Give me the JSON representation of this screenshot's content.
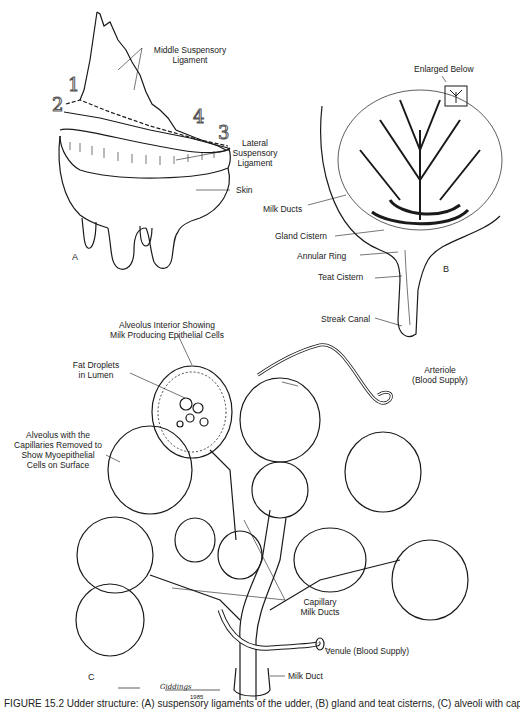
{
  "figure": {
    "panels": [
      {
        "id": "A",
        "letter": "A",
        "labels": {
          "middle_suspensory_ligament": "Middle Suspensory\nLigament",
          "middle_line1": "Middle Suspensory",
          "middle_line2": "Ligament",
          "lateral_line1": "Lateral",
          "lateral_line2": "Suspensory",
          "lateral_line3": "Ligament",
          "skin": "Skin"
        },
        "numbers": [
          "1",
          "2",
          "3",
          "4"
        ]
      },
      {
        "id": "B",
        "letter": "B",
        "labels": {
          "enlarged_below": "Enlarged Below",
          "milk_ducts": "Milk Ducts",
          "gland_cistern": "Gland Cistern",
          "annular_ring": "Annular Ring",
          "teat_cistern": "Teat Cistern",
          "streak_canal": "Streak Canal"
        }
      },
      {
        "id": "C",
        "letter": "C",
        "labels": {
          "alveolus_interior_line1": "Alveolus Interior Showing",
          "alveolus_interior_line2": "Milk Producing Epithelial Cells",
          "fat_droplets_line1": "Fat Droplets",
          "fat_droplets_line2": "in Lumen",
          "alveolus_capillaries_line1": "Alveolus with the",
          "alveolus_capillaries_line2": "Capillaries Removed to",
          "alveolus_capillaries_line3": "Show Myoepithelial",
          "alveolus_capillaries_line4": "Cells on Surface",
          "arteriole_line1": "Arteriole",
          "arteriole_line2": "(Blood Supply)",
          "capillary_line1": "Capillary",
          "capillary_line2": "Milk Ducts",
          "venule": "Venule (Blood Supply)",
          "milk_duct": "Milk Duct"
        },
        "signature": "Giddings",
        "signature_year": "1985"
      }
    ],
    "caption": "FIGURE 15.2  Udder structure: (A) suspensory ligaments of the udder, (B) gland and teat cisterns, (C) alveoli with capillaries and milk ducts"
  }
}
